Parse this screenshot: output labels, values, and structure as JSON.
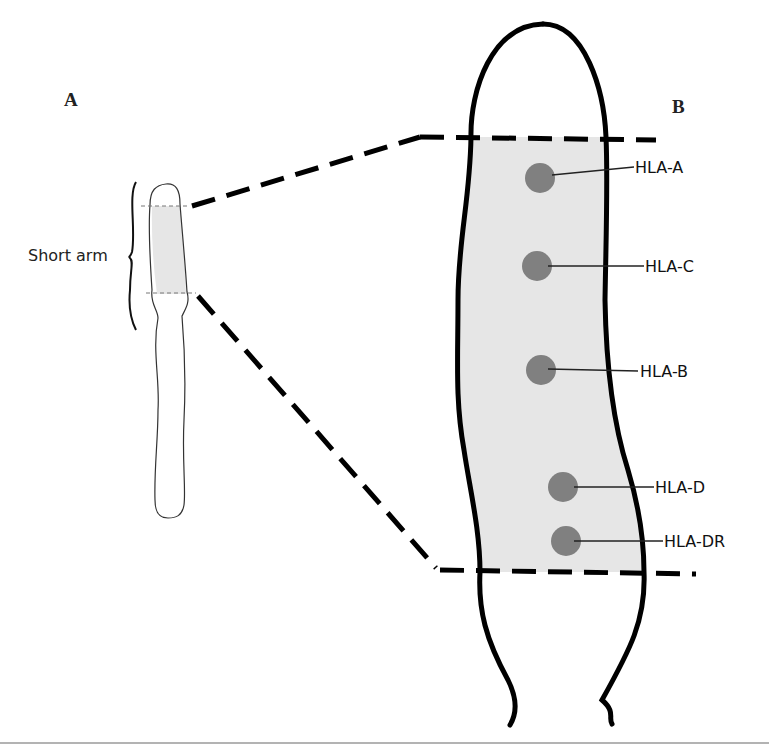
{
  "diagram": {
    "panels": {
      "a": {
        "label": "A"
      },
      "b": {
        "label": "B"
      }
    },
    "chromosome_small": {
      "region_label": "Short arm"
    },
    "genes": [
      {
        "id": "hla-a",
        "label": "HLA-A"
      },
      {
        "id": "hla-c",
        "label": "HLA-C"
      },
      {
        "id": "hla-b",
        "label": "HLA-B"
      },
      {
        "id": "hla-d",
        "label": "HLA-D"
      },
      {
        "id": "hla-dr",
        "label": "HLA-DR"
      }
    ],
    "colors": {
      "outline": "#000000",
      "region_fill": "#e6e6e6",
      "gene_dot": "#808080",
      "rule": "#9a9a9a"
    }
  }
}
